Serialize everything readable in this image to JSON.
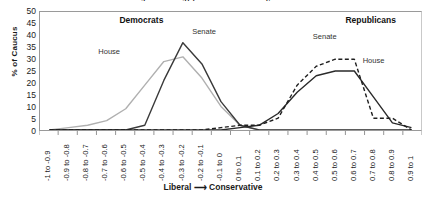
{
  "chart_data": {
    "type": "line",
    "title": "Distribution of 111th Congress Ideology (DW-Nominate Scores), House and Senate Caucuses",
    "xlabel": "Liberal ⟶ Conservative",
    "ylabel": "% of Caucus",
    "ylim": [
      0,
      50
    ],
    "ytick_step": 5,
    "yticks": [
      "0",
      "5",
      "10",
      "15",
      "20",
      "25",
      "30",
      "35",
      "40",
      "45",
      "50"
    ],
    "grid": false,
    "legend_position": "in-plot annotations",
    "categories": [
      "-1 to -0.9",
      "-0.9 to -0.8",
      "-0.8 to -0.7",
      "-0.7 to -0.6",
      "-0.6 to -0.5",
      "-0.5 to -0.4",
      "-0.4 to -0.3",
      "-0.3 to -0.2",
      "-0.2 to -0.1",
      "-0.1 to 0",
      "0 to 0.1",
      "0.1 to 0.2",
      "0.2 to 0.3",
      "0.3 to 0.4",
      "0.4 to 0.5",
      "0.5 to 0.6",
      "0.6 to 0.7",
      "0.7 to 0.8",
      "0.8 to 0.9",
      "0.9 to 1"
    ],
    "group_labels": [
      {
        "text": "Democrats",
        "x_frac": 0.21,
        "y_frac": 0.03
      },
      {
        "text": "Republicans",
        "x_frac": 0.8,
        "y_frac": 0.03
      }
    ],
    "series": [
      {
        "name": "House",
        "group": "Democrats",
        "color": "#b0b0b0",
        "style": "solid",
        "label_x_frac": 0.155,
        "label_y_frac": 0.3,
        "values": [
          0,
          1,
          2,
          4,
          9,
          19,
          29,
          31,
          22,
          10,
          2,
          0,
          0,
          0,
          0,
          0,
          0,
          0,
          0,
          0
        ]
      },
      {
        "name": "Senate",
        "group": "Democrats",
        "color": "#3a3a3a",
        "style": "solid",
        "label_x_frac": 0.4,
        "label_y_frac": 0.135,
        "values": [
          0,
          0,
          0,
          0,
          0,
          2,
          21,
          37,
          28,
          12,
          2,
          0,
          0,
          0,
          0,
          0,
          0,
          0,
          0,
          0
        ]
      },
      {
        "name": "House",
        "group": "Republicans",
        "color": "#2a2a2a",
        "style": "solid",
        "label_x_frac": 0.845,
        "label_y_frac": 0.375,
        "values": [
          0,
          0,
          0,
          0,
          0,
          0,
          0,
          0,
          0,
          0,
          1,
          2,
          7,
          16,
          23,
          25,
          25,
          14,
          3,
          1
        ]
      },
      {
        "name": "Senate",
        "group": "Republicans",
        "color": "#1f1f1f",
        "style": "dashed",
        "label_x_frac": 0.715,
        "label_y_frac": 0.175,
        "values": [
          0,
          0,
          0,
          0,
          0,
          0,
          0,
          0,
          0,
          1,
          2,
          2,
          5,
          19,
          27,
          30,
          30,
          5,
          5,
          0
        ]
      }
    ]
  }
}
